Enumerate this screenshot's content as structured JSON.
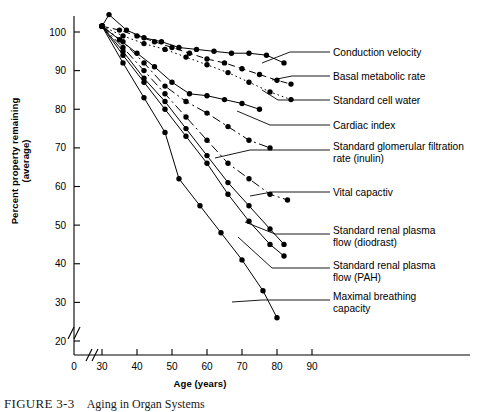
{
  "figure": {
    "caption_label": "FIGURE 3-3",
    "caption_text": "Aging in Organ Systems"
  },
  "chart_data": {
    "type": "line",
    "title": "",
    "xlabel": "Age (years)",
    "ylabel": "Percent property remaining (average)",
    "xlim": [
      28,
      96
    ],
    "ylim": [
      15,
      105
    ],
    "xticks": [
      0,
      30,
      40,
      50,
      60,
      70,
      80,
      90
    ],
    "yticks": [
      20,
      30,
      40,
      50,
      60,
      70,
      80,
      90,
      100
    ],
    "grid": false,
    "legend": "right-labels-with-leader-lines",
    "axis_break_x": true,
    "axis_break_y": true,
    "marker": "filled-circle",
    "series": [
      {
        "name": "Conduction velocity",
        "style": "solid",
        "label_x": 333,
        "label_y": 52,
        "leader": [
          [
            262,
            63
          ],
          [
            290,
            52
          ],
          [
            330,
            52
          ]
        ],
        "x": [
          30,
          32,
          37,
          42,
          47,
          52,
          57,
          62,
          67,
          72,
          77,
          82
        ],
        "y": [
          101.5,
          104.5,
          100.5,
          98.5,
          97.5,
          96,
          95.5,
          95,
          94.5,
          94.5,
          94,
          92
        ]
      },
      {
        "name": "Basal metabolic rate",
        "style": "dashed",
        "label_x": 333,
        "label_y": 76,
        "leader": [
          [
            272,
            80
          ],
          [
            292,
            76
          ],
          [
            330,
            76
          ]
        ],
        "x": [
          30,
          35,
          40,
          45,
          50,
          55,
          60,
          65,
          70,
          75,
          80,
          84
        ],
        "y": [
          101.5,
          100.5,
          99,
          97.5,
          96,
          94.5,
          93,
          92,
          90.5,
          89,
          87.5,
          86.5
        ]
      },
      {
        "name": "Standard cell water",
        "style": "dotted",
        "label_x": 333,
        "label_y": 100,
        "leader": [
          [
            262,
            90
          ],
          [
            278,
            100
          ],
          [
            330,
            100
          ]
        ],
        "x": [
          30,
          36,
          42,
          48,
          54,
          60,
          66,
          72,
          78,
          84
        ],
        "y": [
          101.5,
          99,
          97,
          95.5,
          93.5,
          91.5,
          89.5,
          87,
          84.5,
          82.5
        ]
      },
      {
        "name": "Cardiac index",
        "style": "solid",
        "label_x": 333,
        "label_y": 125,
        "leader": [
          [
            237,
            111
          ],
          [
            270,
            125
          ],
          [
            330,
            125
          ]
        ],
        "x": [
          30,
          35,
          40,
          45,
          50,
          55,
          60,
          65,
          70,
          75
        ],
        "y": [
          101.5,
          98,
          94.5,
          91,
          87,
          84,
          83.5,
          82.5,
          81.5,
          80
        ]
      },
      {
        "name": "Standard glomerular filtration rate (inulin)",
        "style": "dashdot",
        "label_x": 333,
        "label_y": 146,
        "lines": 2,
        "leader": [
          [
            215,
            158
          ],
          [
            250,
            150
          ],
          [
            330,
            150
          ]
        ],
        "x": [
          30,
          36,
          42,
          48,
          54,
          60,
          66,
          72,
          78
        ],
        "y": [
          101.5,
          97.5,
          92,
          86,
          82,
          79,
          75.5,
          72,
          70
        ]
      },
      {
        "name": "Vital capactiv",
        "style": "dashdot",
        "label_x": 333,
        "label_y": 192,
        "leader": [
          [
            250,
            196
          ],
          [
            272,
            192
          ],
          [
            330,
            192
          ]
        ],
        "x": [
          30,
          36,
          42,
          48,
          54,
          60,
          66,
          72,
          78,
          83
        ],
        "y": [
          101.5,
          96,
          90,
          84,
          78,
          72,
          66,
          62,
          58,
          56.5
        ]
      },
      {
        "name": "Standard renal plasma flow (diodrast)",
        "style": "solid",
        "label_x": 333,
        "label_y": 230,
        "lines": 2,
        "leader": [
          [
            245,
            222
          ],
          [
            275,
            234
          ],
          [
            330,
            234
          ]
        ],
        "x": [
          30,
          36,
          42,
          48,
          54,
          60,
          66,
          72,
          78,
          82
        ],
        "y": [
          101.5,
          95,
          88,
          82,
          75,
          68,
          61,
          55,
          49,
          45
        ]
      },
      {
        "name": "Standard renal plasma flow (PAH)",
        "style": "solid",
        "label_x": 333,
        "label_y": 265,
        "lines": 2,
        "leader": [
          [
            238,
            237
          ],
          [
            272,
            268
          ],
          [
            330,
            268
          ]
        ],
        "x": [
          30,
          36,
          42,
          48,
          54,
          60,
          66,
          72,
          78,
          82
        ],
        "y": [
          101.5,
          94,
          87,
          80,
          73,
          66,
          58,
          51,
          45,
          42
        ]
      },
      {
        "name": "Maximal breathing capacity",
        "style": "solid",
        "label_x": 333,
        "label_y": 296,
        "lines": 2,
        "leader": [
          [
            232,
            302
          ],
          [
            262,
            300
          ],
          [
            330,
            300
          ]
        ],
        "x": [
          30,
          36,
          42,
          48,
          52,
          58,
          64,
          70,
          76,
          80
        ],
        "y": [
          101.5,
          92,
          83,
          74,
          62,
          55,
          48,
          41,
          33,
          26
        ]
      }
    ]
  }
}
